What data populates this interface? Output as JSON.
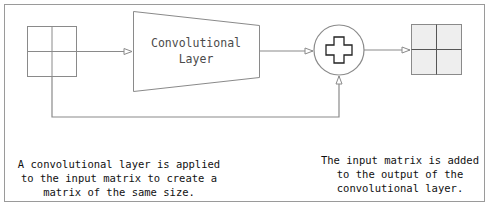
{
  "diagram": {
    "nodes": {
      "input_matrix": {
        "label": "",
        "shape": "2x2 grid",
        "fill": "#ffffff"
      },
      "conv_layer": {
        "label_line1": "Convolutional",
        "label_line2": "Layer",
        "shape": "trapezoid"
      },
      "add_op": {
        "symbol": "plus",
        "shape": "circle"
      },
      "output_matrix": {
        "label": "",
        "shape": "2x2 grid",
        "fill": "#eeeeee"
      }
    },
    "edges": [
      {
        "from": "input_matrix",
        "to": "conv_layer"
      },
      {
        "from": "conv_layer",
        "to": "add_op"
      },
      {
        "from": "input_matrix",
        "to": "add_op",
        "type": "skip connection"
      },
      {
        "from": "add_op",
        "to": "output_matrix"
      }
    ],
    "colors": {
      "stroke": "#8a8a8a",
      "plus_stroke": "#222222",
      "output_fill": "#eeeeee"
    }
  },
  "captions": {
    "left": {
      "line1": "A convolutional layer is applied",
      "line2": "to the input matrix to create a",
      "line3": "matrix of the same size."
    },
    "right": {
      "line1": "The input matrix is added",
      "line2": "to the output of the",
      "line3": "convolutional layer."
    }
  }
}
